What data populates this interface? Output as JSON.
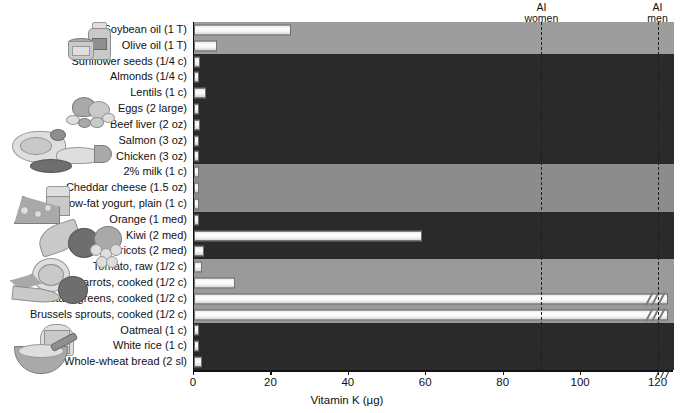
{
  "chart_data": {
    "type": "bar",
    "orientation": "horizontal",
    "title": "",
    "xlabel": "Vitamin K (µg)",
    "ylabel": "",
    "xlim": [
      0,
      124
    ],
    "xticks": [
      0,
      20,
      40,
      60,
      80,
      100,
      120
    ],
    "xticklabels": [
      "0",
      "20",
      "40",
      "60",
      "80",
      "100",
      "120"
    ],
    "grid": false,
    "legend": "none",
    "axis_break": true,
    "categories": [
      "Soybean oil (1 T)",
      "Olive oil (1 T)",
      "Sunflower seeds (1/4 c)",
      "Almonds (1/4 c)",
      "Lentils (1 c)",
      "Eggs (2 large)",
      "Beef liver (2 oz)",
      "Salmon (3 oz)",
      "Chicken (3 oz)",
      "2% milk (1 c)",
      "Cheddar cheese (1.5 oz)",
      "Low-fat yogurt, plain (1 c)",
      "Orange (1 med)",
      "Kiwi (2 med)",
      "Apricots (2 med)",
      "Tomato, raw (1/2 c)",
      "Carrots, cooked (1/2 c)",
      "Mustard greens, cooked (1/2 c)",
      "Brussels sprouts, cooked (1/2 c)",
      "Oatmeal (1 c)",
      "White rice (1 c)",
      "Whole-wheat bread (2 sl)"
    ],
    "values": [
      25,
      6,
      1.5,
      0.5,
      3,
      0.3,
      1.5,
      0.4,
      0.4,
      0.3,
      0.5,
      0.3,
      0.2,
      59,
      2.5,
      2,
      10.5,
      124,
      124,
      1,
      0.1,
      2
    ],
    "broken_bars": [
      "Mustard greens, cooked (1/2 c)",
      "Brussels sprouts, cooked (1/2 c)"
    ],
    "reference_lines": [
      {
        "label_top": "AI",
        "label_bottom": "women",
        "value": 90
      },
      {
        "label_top": "AI",
        "label_bottom": "men",
        "value": 120
      }
    ],
    "groups": [
      {
        "name": "oils",
        "start": 0,
        "count": 2,
        "shade": "light"
      },
      {
        "name": "protein",
        "start": 2,
        "count": 7,
        "shade": "dark"
      },
      {
        "name": "dairy",
        "start": 9,
        "count": 3,
        "shade": "mid"
      },
      {
        "name": "fruits",
        "start": 12,
        "count": 3,
        "shade": "dark"
      },
      {
        "name": "vegetables",
        "start": 15,
        "count": 4,
        "shade": "veg"
      },
      {
        "name": "grains",
        "start": 19,
        "count": 3,
        "shade": "dark"
      }
    ]
  },
  "colors": {
    "band_light": "#9d9d9d",
    "band_dark": "#2a2a2a",
    "band_mid": "#8c8c8c",
    "band_veg": "#9a9a9a",
    "bar_fill": "#ffffff",
    "axis": "#111111",
    "reference_line": "#1d1d1d"
  },
  "icons": [
    {
      "name": "oils-illustration",
      "group": "oils"
    },
    {
      "name": "legumes-illustration",
      "group": "protein"
    },
    {
      "name": "meat-poultry-fish-illustration",
      "group": "protein"
    },
    {
      "name": "dairy-illustration",
      "group": "dairy"
    },
    {
      "name": "fruits-illustration",
      "group": "fruits"
    },
    {
      "name": "vegetables-illustration",
      "group": "vegetables"
    },
    {
      "name": "grains-illustration",
      "group": "grains"
    }
  ]
}
